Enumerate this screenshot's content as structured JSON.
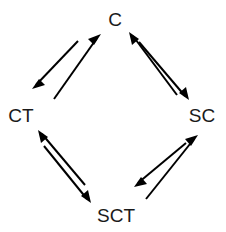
{
  "diagram": {
    "type": "directed-graph",
    "background_color": "#ffffff",
    "stroke_color": "#000000",
    "text_color": "#1a1a1a",
    "nodes": [
      {
        "id": "C",
        "label": "C",
        "x": 115,
        "y": 19,
        "position": "top"
      },
      {
        "id": "CT",
        "label": "CT",
        "x": 21,
        "y": 115,
        "position": "left"
      },
      {
        "id": "SC",
        "label": "SC",
        "x": 202,
        "y": 115,
        "position": "right"
      },
      {
        "id": "SCT",
        "label": "SCT",
        "x": 116,
        "y": 215,
        "position": "bottom"
      }
    ],
    "edges": [
      {
        "id": "c-to-ct",
        "from": "C",
        "to": "CT",
        "label": "",
        "tail_x": 78,
        "tail_y": 41,
        "head_x": 32,
        "head_y": 89
      },
      {
        "id": "ct-to-c",
        "from": "CT",
        "to": "C",
        "label": "",
        "tail_x": 54,
        "tail_y": 99,
        "head_x": 101,
        "head_y": 34
      },
      {
        "id": "sc-to-c",
        "from": "SC",
        "to": "C",
        "label": "",
        "tail_x": 177,
        "tail_y": 95,
        "head_x": 129,
        "head_y": 32
      },
      {
        "id": "c-to-sc",
        "from": "C",
        "to": "SC",
        "label": "",
        "tail_x": 139,
        "tail_y": 42,
        "head_x": 189,
        "head_y": 100
      },
      {
        "id": "sct-to-ct",
        "from": "SCT",
        "to": "CT",
        "label": "",
        "tail_x": 85,
        "tail_y": 185,
        "head_x": 38,
        "head_y": 130
      },
      {
        "id": "ct-to-sct",
        "from": "CT",
        "to": "SCT",
        "label": "",
        "tail_x": 44,
        "tail_y": 146,
        "head_x": 91,
        "head_y": 203
      },
      {
        "id": "sc-to-sct",
        "from": "SC",
        "to": "SCT",
        "label": "",
        "tail_x": 186,
        "tail_y": 143,
        "head_x": 134,
        "head_y": 187
      },
      {
        "id": "sct-to-sc",
        "from": "SCT",
        "to": "SC",
        "label": "",
        "tail_x": 146,
        "tail_y": 199,
        "head_x": 198,
        "head_y": 135
      }
    ]
  }
}
